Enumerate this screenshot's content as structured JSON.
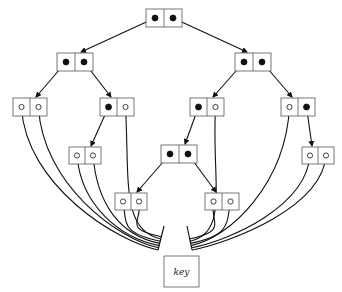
{
  "diagram": {
    "type": "tree-of-pointer-nodes",
    "stroke_color": "#111111",
    "box_stroke_color": "#555555",
    "key_label": "key",
    "nodes": [
      {
        "id": "root",
        "x": 146,
        "y": 9,
        "w": 36,
        "h": 18,
        "cells": [
          "filled",
          "filled"
        ]
      },
      {
        "id": "L",
        "x": 57,
        "y": 53,
        "w": 36,
        "h": 18,
        "cells": [
          "filled",
          "filled"
        ]
      },
      {
        "id": "R",
        "x": 235,
        "y": 53,
        "w": 36,
        "h": 18,
        "cells": [
          "filled",
          "filled"
        ]
      },
      {
        "id": "LL",
        "x": 13,
        "y": 98,
        "w": 34,
        "h": 18,
        "cells": [
          "hollow",
          "hollow"
        ]
      },
      {
        "id": "LR",
        "x": 100,
        "y": 98,
        "w": 34,
        "h": 18,
        "cells": [
          "filled",
          "hollow"
        ]
      },
      {
        "id": "RL",
        "x": 190,
        "y": 98,
        "w": 34,
        "h": 18,
        "cells": [
          "filled",
          "hollow"
        ]
      },
      {
        "id": "RR",
        "x": 281,
        "y": 98,
        "w": 34,
        "h": 18,
        "cells": [
          "hollow",
          "filled"
        ]
      },
      {
        "id": "LRL",
        "x": 69,
        "y": 147,
        "w": 32,
        "h": 17,
        "cells": [
          "hollow",
          "hollow"
        ]
      },
      {
        "id": "RLL",
        "x": 161,
        "y": 145,
        "w": 36,
        "h": 18,
        "cells": [
          "filled",
          "filled"
        ]
      },
      {
        "id": "RRR",
        "x": 302,
        "y": 147,
        "w": 32,
        "h": 17,
        "cells": [
          "hollow",
          "hollow"
        ]
      },
      {
        "id": "RLLL",
        "x": 115,
        "y": 193,
        "w": 32,
        "h": 17,
        "cells": [
          "hollow",
          "hollow"
        ]
      },
      {
        "id": "RLLR",
        "x": 205,
        "y": 193,
        "w": 34,
        "h": 17,
        "cells": [
          "hollow",
          "hollow"
        ]
      }
    ],
    "edges": [
      {
        "from": "root",
        "cell": 0,
        "to": "L"
      },
      {
        "from": "root",
        "cell": 1,
        "to": "R"
      },
      {
        "from": "L",
        "cell": 0,
        "to": "LL"
      },
      {
        "from": "L",
        "cell": 1,
        "to": "LR"
      },
      {
        "from": "R",
        "cell": 0,
        "to": "RL"
      },
      {
        "from": "R",
        "cell": 1,
        "to": "RR"
      },
      {
        "from": "LR",
        "cell": 0,
        "to": "LRL"
      },
      {
        "from": "RL",
        "cell": 0,
        "to": "RLL"
      },
      {
        "from": "RR",
        "cell": 1,
        "to": "RRR"
      },
      {
        "from": "RLL",
        "cell": 0,
        "to": "RLLL"
      },
      {
        "from": "RLL",
        "cell": 1,
        "to": "RLLR"
      }
    ],
    "key_box": {
      "x": 164,
      "y": 256,
      "w": 35,
      "h": 31
    }
  }
}
